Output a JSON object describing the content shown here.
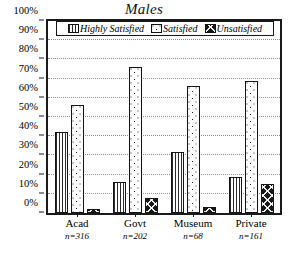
{
  "chart_data": {
    "type": "bar",
    "title": "Males",
    "xlabel": "",
    "ylabel": "",
    "ylim": [
      0,
      100
    ],
    "ytick_labels": [
      "0%",
      "10%",
      "20%",
      "30%",
      "40%",
      "50%",
      "60%",
      "70%",
      "80%",
      "90%",
      "100%"
    ],
    "ytick_values": [
      0,
      10,
      20,
      30,
      40,
      50,
      60,
      70,
      80,
      90,
      100
    ],
    "grid": true,
    "legend_position": "top-inside",
    "categories": [
      "Acad",
      "Govt",
      "Museum",
      "Private"
    ],
    "category_sublabels": [
      "n=316",
      "n=202",
      "n=68",
      "n=161"
    ],
    "series": [
      {
        "name": "Highly Satisfied",
        "pattern": "vertical-stripes",
        "values": [
          42,
          16,
          32,
          19
        ]
      },
      {
        "name": "Satisfied",
        "pattern": "dots",
        "values": [
          56,
          76,
          66,
          69
        ]
      },
      {
        "name": "Unsatisfied",
        "pattern": "crosshatch",
        "values": [
          2,
          8,
          3,
          15
        ]
      }
    ]
  },
  "colors": {
    "axis": "#1a1a1a",
    "grid": "#8c8c8c",
    "ink": "#000000",
    "background": "#ffffff"
  }
}
